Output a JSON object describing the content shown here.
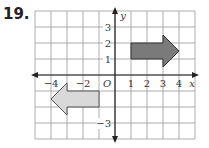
{
  "problem_number": "19.",
  "graph": {
    "x_axis_label": "x",
    "y_axis_label": "y",
    "origin_label": "O",
    "x_tick_labels": [
      {
        "value": -4,
        "label": "−4"
      },
      {
        "value": -2,
        "label": "−2"
      },
      {
        "value": 1,
        "label": "1"
      },
      {
        "value": 2,
        "label": "2"
      },
      {
        "value": 3,
        "label": "3"
      },
      {
        "value": 4,
        "label": "4"
      }
    ],
    "y_tick_labels": [
      {
        "value": 3,
        "label": "3"
      },
      {
        "value": 2,
        "label": "2"
      },
      {
        "value": 1,
        "label": "1"
      },
      {
        "value": -3,
        "label": "−3"
      }
    ],
    "x_range": [
      -5,
      5
    ],
    "y_range": [
      -4,
      4
    ],
    "grid": true,
    "shapes": [
      {
        "name": "original-arrow",
        "fill": "#7a7a7a",
        "stroke": "#333333",
        "vertices": [
          [
            1,
            1
          ],
          [
            3,
            1
          ],
          [
            3,
            0.5
          ],
          [
            4,
            1.5
          ],
          [
            3,
            2.5
          ],
          [
            3,
            2
          ],
          [
            1,
            2
          ]
        ]
      },
      {
        "name": "image-arrow",
        "fill": "#d9d9d9",
        "stroke": "#555555",
        "vertices": [
          [
            -1,
            -1
          ],
          [
            -3,
            -1
          ],
          [
            -3,
            -0.5
          ],
          [
            -4,
            -1.5
          ],
          [
            -3,
            -2.5
          ],
          [
            -3,
            -2
          ],
          [
            -1,
            -2
          ]
        ]
      }
    ],
    "colors": {
      "grid": "#9a9a9a",
      "axis": "#222222"
    }
  }
}
